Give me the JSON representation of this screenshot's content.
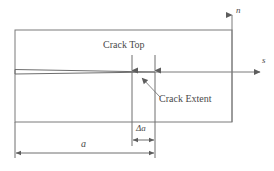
{
  "figure": {
    "stroke_color": "#7a7a7a",
    "text_color": "#4a4a4a",
    "background": "#ffffff",
    "labels": {
      "crack_top": "Crack Top",
      "crack_extent": "Crack Extent",
      "axis_n": "n",
      "axis_s": "s",
      "dim_a": "a",
      "dim_delta_a": "Δa"
    },
    "geometry": {
      "body_rect": {
        "x": 15,
        "y": 30,
        "width": 217,
        "height": 92
      },
      "crack_line_y": 72,
      "crack_mouth_top_y": 69,
      "crack_mouth_bottom_y": 74,
      "crack_tip_x": 155,
      "crack_top_x": 132,
      "axis_n_x": 232,
      "axis_n_tip_y": 13,
      "axis_s_y": 72,
      "axis_s_tip_x": 262,
      "dim_a_y": 153,
      "dim_a_start_x": 15,
      "dim_a_end_x": 155,
      "dim_delta_a_y": 140,
      "dim_delta_a_start_x": 132,
      "dim_delta_a_end_x": 155,
      "leader_from": {
        "x": 159,
        "y": 97
      },
      "leader_to": {
        "x": 141,
        "y": 78
      },
      "arrow_crack_top_x": 132,
      "arrow_crack_tip_x": 155,
      "arrow_top_y": 56,
      "arrow_bottom_y": 71
    }
  }
}
